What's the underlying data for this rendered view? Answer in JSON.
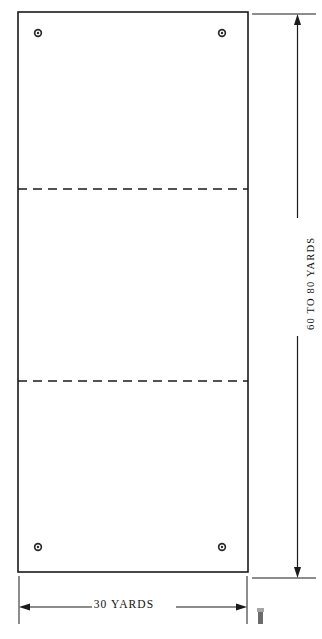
{
  "diagram": {
    "background_color": "#ffffff",
    "line_color": "#1a1a1a",
    "field": {
      "name": "playing-field",
      "border_style": "solid",
      "fill": "#ffffff",
      "left": 18,
      "top": 12,
      "right": 248,
      "bottom": 572
    },
    "dashed_lines": [
      {
        "name": "upper-restraining-line",
        "y": 189,
        "style": "dashed"
      },
      {
        "name": "lower-restraining-line",
        "y": 381,
        "style": "dashed"
      }
    ],
    "corner_markers": [
      {
        "name": "corner-marker-top-left",
        "x": 38,
        "y": 33
      },
      {
        "name": "corner-marker-top-right",
        "x": 222,
        "y": 33
      },
      {
        "name": "corner-marker-bottom-left",
        "x": 38,
        "y": 547
      },
      {
        "name": "corner-marker-bottom-right",
        "x": 222,
        "y": 547
      }
    ],
    "dimensions": {
      "width": {
        "label": "30 YARDS",
        "orientation": "horizontal",
        "position": "bottom"
      },
      "height": {
        "label": "60 TO 80 YARDS",
        "orientation": "vertical-rotated",
        "position": "right"
      }
    }
  }
}
